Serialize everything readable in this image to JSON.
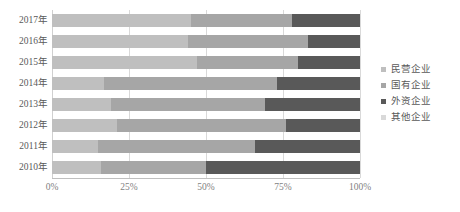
{
  "chart_data": {
    "type": "bar",
    "orientation": "horizontal",
    "stacked": true,
    "normalized": true,
    "title": "",
    "subtitle": "",
    "xlabel": "",
    "ylabel": "",
    "xlim": [
      0,
      100
    ],
    "xticks": [
      0,
      25,
      50,
      75,
      100
    ],
    "xtick_labels": [
      "0%",
      "25%",
      "50%",
      "75%",
      "100%"
    ],
    "grid": true,
    "grid_axis": "x",
    "legend_position": "right",
    "categories": [
      "2017年",
      "2016年",
      "2015年",
      "2014年",
      "2013年",
      "2012年",
      "2011年",
      "2010年"
    ],
    "series": [
      {
        "name": "民营企业",
        "color": "#bfbfbf",
        "values": [
          45,
          44,
          47,
          17,
          19,
          21,
          15,
          16
        ]
      },
      {
        "name": "国有企业",
        "color": "#a6a6a6",
        "values": [
          33,
          39,
          33,
          56,
          50,
          55,
          51,
          34
        ]
      },
      {
        "name": "外资企业",
        "color": "#595959",
        "values": [
          22,
          17,
          20,
          27,
          31,
          24,
          34,
          50
        ]
      },
      {
        "name": "其他企业",
        "color": "#d9d9d9",
        "values": [
          0,
          0,
          0,
          0,
          0,
          0,
          0,
          0
        ]
      }
    ]
  },
  "legend": {
    "items": [
      {
        "label": "民营企业",
        "color": "#bfbfbf"
      },
      {
        "label": "国有企业",
        "color": "#a6a6a6"
      },
      {
        "label": "外资企业",
        "color": "#595959"
      },
      {
        "label": "其他企业",
        "color": "#d9d9d9"
      }
    ]
  },
  "caption": {
    "text": ""
  }
}
